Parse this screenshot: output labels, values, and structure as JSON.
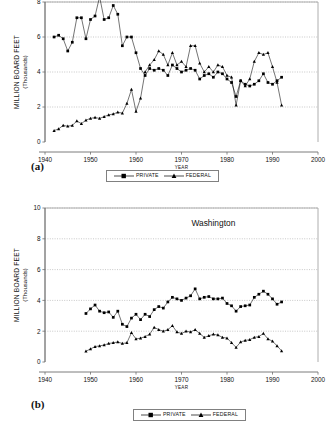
{
  "figure": {
    "panels": [
      {
        "id": "a",
        "label": "(a)",
        "title": ""
      },
      {
        "id": "b",
        "label": "(b)",
        "title": "Washington"
      }
    ],
    "legend": {
      "entries": [
        {
          "name": "PRIVATE",
          "marker": "square",
          "color": "#000000"
        },
        {
          "name": "FEDERAL",
          "marker": "triangle",
          "color": "#000000"
        }
      ]
    }
  },
  "chart_data": [
    {
      "type": "line",
      "panel": "a",
      "title": "",
      "xlabel": "YEAR",
      "ylabel": "MILLION BOARD FEET",
      "ylabel_sub": "(Thousands)",
      "xlim": [
        1940,
        2000
      ],
      "ylim": [
        0,
        8
      ],
      "xticks": [
        1940,
        1950,
        1960,
        1970,
        1980,
        1990,
        2000
      ],
      "yticks": [
        0,
        2,
        4,
        6,
        8
      ],
      "grid": "horizontal-dotted",
      "legend_position": "below-axes",
      "x": [
        1942,
        1943,
        1944,
        1945,
        1946,
        1947,
        1948,
        1949,
        1950,
        1951,
        1952,
        1953,
        1954,
        1955,
        1956,
        1957,
        1958,
        1959,
        1960,
        1961,
        1962,
        1963,
        1964,
        1965,
        1966,
        1967,
        1968,
        1969,
        1970,
        1971,
        1972,
        1973,
        1974,
        1975,
        1976,
        1977,
        1978,
        1979,
        1980,
        1981,
        1982,
        1983,
        1984,
        1985,
        1986,
        1987,
        1988,
        1989,
        1990,
        1991,
        1992
      ],
      "series": [
        {
          "name": "PRIVATE",
          "marker": "square",
          "values": [
            6.0,
            6.1,
            5.9,
            5.2,
            5.7,
            7.1,
            7.1,
            5.9,
            7.0,
            7.2,
            8.3,
            7.0,
            7.1,
            7.8,
            7.3,
            5.5,
            6.0,
            6.0,
            5.1,
            4.2,
            3.8,
            4.2,
            4.1,
            4.2,
            4.1,
            3.8,
            4.4,
            4.2,
            4.0,
            4.1,
            4.2,
            4.1,
            3.6,
            3.8,
            3.9,
            3.7,
            4.0,
            3.9,
            3.6,
            3.4,
            2.6,
            3.5,
            3.3,
            3.2,
            3.3,
            3.5,
            3.9,
            3.4,
            3.3,
            3.5,
            3.7
          ]
        },
        {
          "name": "FEDERAL",
          "marker": "triangle",
          "values": [
            0.65,
            0.75,
            0.95,
            0.9,
            0.95,
            1.2,
            1.05,
            1.25,
            1.35,
            1.4,
            1.35,
            1.45,
            1.55,
            1.6,
            1.7,
            1.65,
            2.2,
            3.0,
            1.75,
            2.5,
            4.0,
            4.4,
            4.7,
            5.2,
            5.0,
            4.4,
            5.1,
            4.4,
            4.6,
            4.3,
            5.5,
            5.5,
            4.5,
            4.0,
            4.3,
            4.0,
            4.4,
            4.3,
            3.8,
            3.7,
            2.1,
            3.5,
            3.2,
            3.6,
            4.6,
            5.1,
            5.0,
            5.1,
            4.3,
            3.4,
            2.1
          ]
        }
      ]
    },
    {
      "type": "line",
      "panel": "b",
      "title": "Washington",
      "xlabel": "YEAR",
      "ylabel": "MILLION BOARD FEET",
      "ylabel_sub": "(Thousands)",
      "xlim": [
        1940,
        2000
      ],
      "ylim": [
        0,
        10
      ],
      "xticks": [
        1940,
        1950,
        1960,
        1970,
        1980,
        1990,
        2000
      ],
      "yticks": [
        0,
        2,
        4,
        6,
        8,
        10
      ],
      "grid": "horizontal-dotted",
      "legend_position": "below-axes",
      "x": [
        1949,
        1950,
        1951,
        1952,
        1953,
        1954,
        1955,
        1956,
        1957,
        1958,
        1959,
        1960,
        1961,
        1962,
        1963,
        1964,
        1965,
        1966,
        1967,
        1968,
        1969,
        1970,
        1971,
        1972,
        1973,
        1974,
        1975,
        1976,
        1977,
        1978,
        1979,
        1980,
        1981,
        1982,
        1983,
        1984,
        1985,
        1986,
        1987,
        1988,
        1989,
        1990,
        1991,
        1992
      ],
      "series": [
        {
          "name": "PRIVATE",
          "marker": "square",
          "values": [
            3.15,
            3.45,
            3.7,
            3.3,
            3.2,
            3.25,
            2.9,
            3.3,
            2.45,
            2.3,
            2.85,
            3.1,
            2.75,
            3.1,
            2.95,
            3.4,
            3.6,
            3.5,
            3.9,
            4.2,
            4.1,
            4.0,
            4.15,
            4.3,
            4.75,
            4.1,
            4.2,
            4.25,
            4.1,
            4.1,
            4.15,
            3.8,
            3.65,
            3.3,
            3.6,
            3.65,
            3.7,
            4.2,
            4.4,
            4.6,
            4.4,
            4.1,
            3.75,
            3.9
          ]
        },
        {
          "name": "FEDERAL",
          "marker": "triangle",
          "values": [
            0.7,
            0.85,
            1.0,
            1.05,
            1.1,
            1.2,
            1.25,
            1.3,
            1.2,
            1.25,
            1.9,
            1.5,
            1.55,
            1.65,
            1.8,
            2.25,
            2.1,
            2.0,
            2.1,
            2.35,
            1.95,
            1.85,
            2.0,
            1.95,
            2.1,
            1.85,
            1.6,
            1.7,
            1.8,
            1.75,
            1.6,
            1.55,
            1.25,
            0.95,
            1.3,
            1.4,
            1.45,
            1.6,
            1.65,
            1.85,
            1.5,
            1.35,
            1.05,
            0.72
          ]
        }
      ]
    }
  ]
}
